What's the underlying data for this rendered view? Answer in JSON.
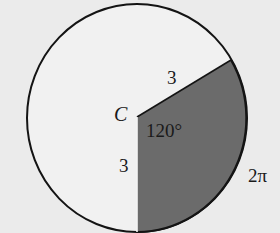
{
  "figure": {
    "center_label": "C",
    "angle_label": "120°",
    "radius_label_upper": "3",
    "radius_label_lower": "3",
    "arc_label": "2π",
    "colors": {
      "background": "#ebebeb",
      "circle_fill": "#f1f1f1",
      "sector_fill": "#6b6b6b",
      "stroke": "#141414"
    },
    "geometry": {
      "center": [
        137,
        117
      ],
      "rx": 110,
      "ry": 114,
      "sector_start_point": [
        231,
        60
      ],
      "sector_end_point": [
        137,
        232
      ],
      "central_angle_deg": 120,
      "radius": 3,
      "arc_length": "2π"
    }
  }
}
